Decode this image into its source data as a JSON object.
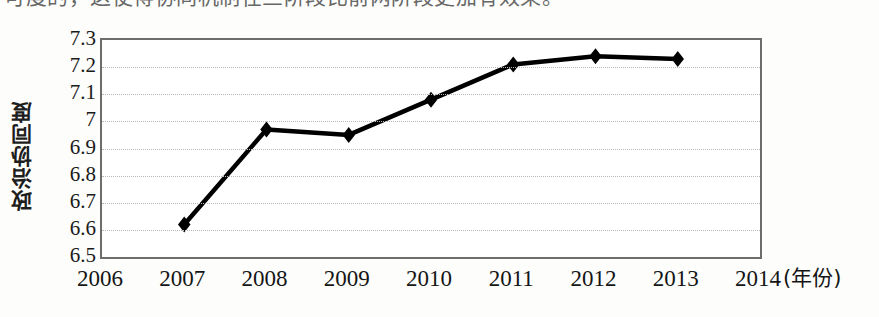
{
  "page": {
    "cut_off_text_above": "可度的，这使得协同机制在三阶段比前两阶段更加有效果。"
  },
  "chart_data": {
    "type": "line",
    "title": "",
    "xlabel": "(年份)",
    "ylabel": "政治协同度",
    "x": [
      2006,
      2007,
      2008,
      2009,
      2010,
      2011,
      2012,
      2013,
      2014
    ],
    "xtick_labels": [
      "2006",
      "2007",
      "2008",
      "2009",
      "2010",
      "2011",
      "2012",
      "2013",
      "2014"
    ],
    "ytick_labels": [
      "7.3",
      "7.2",
      "7.1",
      "7",
      "6.9",
      "6.8",
      "6.7",
      "6.6",
      "6.5"
    ],
    "ytick_values": [
      7.3,
      7.2,
      7.1,
      7.0,
      6.9,
      6.8,
      6.7,
      6.6,
      6.5
    ],
    "ylim": [
      6.5,
      7.3
    ],
    "xlim": [
      2006,
      2014
    ],
    "grid": "horizontal-dotted",
    "legend": "none",
    "marker": "diamond",
    "line_color": "#000000",
    "marker_color": "#000000",
    "series": [
      {
        "name": "政治协同度",
        "points": [
          {
            "x": 2007,
            "y": 6.62
          },
          {
            "x": 2008,
            "y": 6.97
          },
          {
            "x": 2009,
            "y": 6.95
          },
          {
            "x": 2010,
            "y": 7.08
          },
          {
            "x": 2011,
            "y": 7.21
          },
          {
            "x": 2012,
            "y": 7.24
          },
          {
            "x": 2013,
            "y": 7.23
          }
        ]
      }
    ]
  },
  "colors": {
    "axis": "#6d6d6d",
    "grid": "#b9b9b9",
    "text": "#1a1a1a",
    "plot_background": "#ffffff",
    "page_background": "#fdfdfb"
  }
}
